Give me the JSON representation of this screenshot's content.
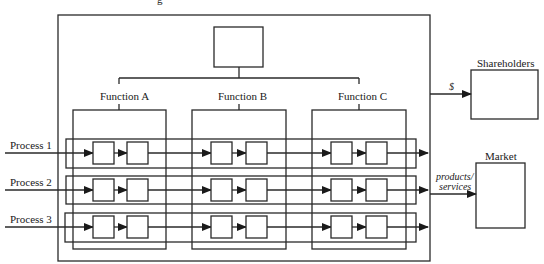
{
  "diagram": {
    "type": "organizational-process-matrix",
    "top_fragment": "g",
    "center_box_label": "",
    "functions": [
      {
        "label": "Function A"
      },
      {
        "label": "Function B"
      },
      {
        "label": "Function C"
      }
    ],
    "processes": [
      {
        "label": "Process 1"
      },
      {
        "label": "Process 2"
      },
      {
        "label": "Process 3"
      }
    ],
    "external": {
      "shareholders": {
        "label": "Shareholders",
        "flow_label": "$"
      },
      "market": {
        "label": "Market",
        "flow_label_line1": "products/",
        "flow_label_line2": "services"
      }
    },
    "colors": {
      "stroke": "#2a2a2a",
      "background": "#ffffff"
    }
  }
}
